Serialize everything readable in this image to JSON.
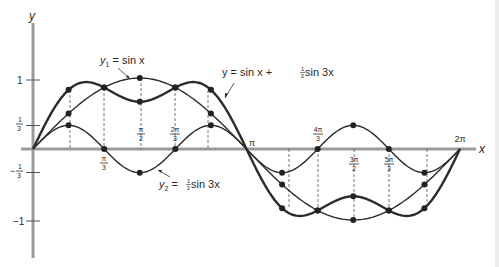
{
  "chart_data": {
    "type": "line",
    "title": "",
    "xlabel": "x",
    "ylabel": "y",
    "xlim": [
      0,
      6.2832
    ],
    "ylim": [
      -1.2,
      1.35
    ],
    "grid": false,
    "x_ticks": [
      {
        "value": 1.0472,
        "label": "π/3",
        "pos": "below"
      },
      {
        "value": 1.5708,
        "label": "π/2",
        "pos": "above"
      },
      {
        "value": 2.0944,
        "label": "2π/3",
        "pos": "above"
      },
      {
        "value": 3.1416,
        "label": "π",
        "pos": "above"
      },
      {
        "value": 4.1888,
        "label": "4π/3",
        "pos": "above"
      },
      {
        "value": 4.7124,
        "label": "3π/2",
        "pos": "below"
      },
      {
        "value": 5.236,
        "label": "5π/3",
        "pos": "below"
      },
      {
        "value": 6.2832,
        "label": "2π",
        "pos": "above"
      }
    ],
    "y_ticks": [
      {
        "value": 1,
        "label": "1"
      },
      {
        "value": 0.3333,
        "label": "1/3"
      },
      {
        "value": -0.3333,
        "label": "−1/3"
      },
      {
        "value": -1,
        "label": "−1"
      }
    ],
    "series": [
      {
        "name": "y1 = sin x",
        "label": "y₁ = sin x",
        "stroke_width": 1.4,
        "marked_x": [
          0.5236,
          1.0472,
          1.5708,
          2.0944,
          2.618,
          3.6652,
          4.1888,
          4.7124,
          5.236,
          5.7596
        ],
        "marked_y": [
          0.5,
          0.866,
          1.0,
          0.866,
          0.5,
          -0.5,
          -0.866,
          -1.0,
          -0.866,
          -0.5
        ]
      },
      {
        "name": "y2 = (1/3) sin 3x",
        "label": "y₂ = ⅓ sin 3x",
        "stroke_width": 1.4,
        "marked_x": [
          0.5236,
          1.0472,
          1.5708,
          2.0944,
          2.618,
          3.6652,
          4.1888,
          4.7124,
          5.236,
          5.7596
        ],
        "marked_y": [
          0.3333,
          0,
          -0.3333,
          0,
          0.3333,
          -0.3333,
          0,
          0.3333,
          0,
          -0.3333
        ]
      },
      {
        "name": "y = sin x + (1/3) sin 3x",
        "label": "y = sin x + ⅓ sin 3x",
        "stroke_width": 2.4,
        "marked_x": [
          0.5236,
          1.0472,
          1.5708,
          2.0944,
          2.618,
          3.6652,
          4.1888,
          4.7124,
          5.236,
          5.7596
        ],
        "marked_y": [
          0.8333,
          0.866,
          0.6667,
          0.866,
          0.8333,
          -0.8333,
          -0.866,
          -0.6667,
          -0.866,
          -0.8333
        ]
      }
    ],
    "guide_lines_at_x": [
      0.5236,
      1.0472,
      1.5708,
      2.0944,
      2.618,
      3.6652,
      4.1888,
      4.7124,
      5.236,
      5.7596
    ],
    "annotations": [
      {
        "text": "y₁ = sin x",
        "target_series": 0
      },
      {
        "text": "y₂ = ⅓ sin 3x",
        "target_series": 1
      },
      {
        "text": "y = sin x + ⅓ sin 3x",
        "target_series": 2
      }
    ]
  },
  "labels": {
    "y_axis": "y",
    "x_axis": "x",
    "y1": {
      "prefix": "y",
      "sub": "1",
      "rest": " = sin x"
    },
    "y2": {
      "prefix": "y",
      "sub": "2",
      "eq": " = ",
      "frac_num": "1",
      "frac_den": "3",
      "rest": " sin 3x"
    },
    "sum": {
      "lead": "y = sin x + ",
      "frac_num": "1",
      "frac_den": "3",
      "rest": " sin 3x"
    },
    "yticks": {
      "one": "1",
      "third_num": "1",
      "third_den": "3",
      "neg": "−",
      "neg_one": "−1"
    },
    "xticks": {
      "pi_3": {
        "num": "π",
        "den": "3"
      },
      "pi_2": {
        "num": "π",
        "den": "2"
      },
      "two_pi_3": {
        "num": "2π",
        "den": "3"
      },
      "pi": "π",
      "four_pi_3": {
        "num": "4π",
        "den": "3"
      },
      "three_pi_2": {
        "num": "3π",
        "den": "2"
      },
      "five_pi_3": {
        "num": "5π",
        "den": "3"
      },
      "two_pi": "2π"
    }
  },
  "colors": {
    "axis": "#9a9a9a",
    "curve": "#2b2b2b",
    "guide": "#555555",
    "background": "#ffffff"
  }
}
